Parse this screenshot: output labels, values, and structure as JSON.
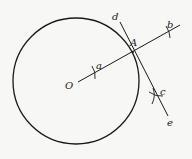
{
  "diagram": {
    "circle": {
      "center_label": "O",
      "cx": 76,
      "cy": 81,
      "r": 63
    },
    "radius_line": {
      "label_start": "O",
      "through": "A",
      "arc_marks": [
        "a",
        "b"
      ]
    },
    "tangent_line": {
      "label_top": "d",
      "label_bottom": "e",
      "point_label": "A",
      "arc_mark": "c"
    },
    "labels": {
      "O": "O",
      "A": "A",
      "a": "a",
      "b": "b",
      "c": "c",
      "d": "d",
      "e": "e"
    },
    "colors": {
      "stroke": "#1a1a1a",
      "background": "#f7f7f5"
    }
  }
}
